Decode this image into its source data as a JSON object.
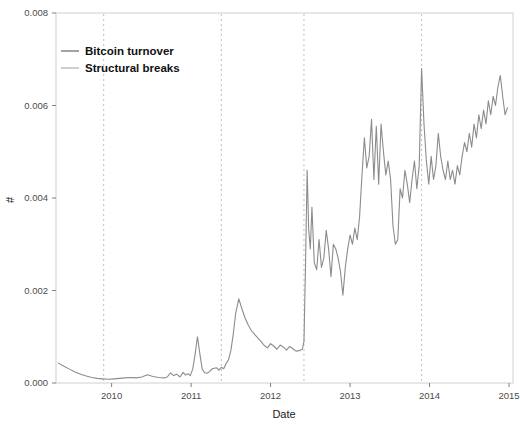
{
  "chart_data": {
    "type": "line",
    "title": "",
    "xlabel": "Date",
    "ylabel": "#",
    "xlim": [
      2009.3,
      2015.05
    ],
    "ylim": [
      0.0,
      0.008
    ],
    "grid": false,
    "legend_position": "top-left",
    "x_tick_labels": [
      "2010",
      "2011",
      "2012",
      "2013",
      "2014",
      "2015"
    ],
    "x_tick_values": [
      2010,
      2011,
      2012,
      2013,
      2014,
      2015
    ],
    "y_tick_labels": [
      "0.000",
      "0.002",
      "0.004",
      "0.006",
      "0.008"
    ],
    "y_tick_values": [
      0.0,
      0.002,
      0.004,
      0.006,
      0.008
    ],
    "series": [
      {
        "name": "Bitcoin turnover",
        "type": "line",
        "color": "#8c8c8c",
        "x": [
          2009.33,
          2009.4,
          2009.47,
          2009.54,
          2009.61,
          2009.68,
          2009.75,
          2009.82,
          2009.89,
          2009.96,
          2010.03,
          2010.1,
          2010.17,
          2010.24,
          2010.31,
          2010.38,
          2010.45,
          2010.52,
          2010.59,
          2010.66,
          2010.7,
          2010.74,
          2010.78,
          2010.82,
          2010.86,
          2010.9,
          2010.93,
          2010.96,
          2010.99,
          2011.02,
          2011.05,
          2011.08,
          2011.11,
          2011.14,
          2011.17,
          2011.2,
          2011.23,
          2011.26,
          2011.29,
          2011.32,
          2011.35,
          2011.38,
          2011.41,
          2011.44,
          2011.47,
          2011.5,
          2011.53,
          2011.56,
          2011.6,
          2011.64,
          2011.68,
          2011.72,
          2011.76,
          2011.8,
          2011.84,
          2011.88,
          2011.92,
          2011.96,
          2012.0,
          2012.04,
          2012.08,
          2012.12,
          2012.16,
          2012.2,
          2012.24,
          2012.28,
          2012.32,
          2012.36,
          2012.4,
          2012.42,
          2012.44,
          2012.46,
          2012.48,
          2012.5,
          2012.52,
          2012.55,
          2012.58,
          2012.61,
          2012.64,
          2012.67,
          2012.7,
          2012.73,
          2012.76,
          2012.79,
          2012.82,
          2012.85,
          2012.88,
          2012.91,
          2012.94,
          2012.97,
          2013.0,
          2013.03,
          2013.06,
          2013.09,
          2013.12,
          2013.15,
          2013.18,
          2013.21,
          2013.24,
          2013.27,
          2013.3,
          2013.33,
          2013.36,
          2013.39,
          2013.42,
          2013.45,
          2013.48,
          2013.51,
          2013.54,
          2013.57,
          2013.6,
          2013.63,
          2013.66,
          2013.69,
          2013.72,
          2013.75,
          2013.78,
          2013.81,
          2013.84,
          2013.87,
          2013.9,
          2013.93,
          2013.96,
          2013.99,
          2014.02,
          2014.05,
          2014.08,
          2014.11,
          2014.14,
          2014.17,
          2014.2,
          2014.23,
          2014.26,
          2014.29,
          2014.32,
          2014.35,
          2014.38,
          2014.41,
          2014.44,
          2014.47,
          2014.5,
          2014.53,
          2014.56,
          2014.59,
          2014.62,
          2014.65,
          2014.68,
          2014.71,
          2014.74,
          2014.77,
          2014.8,
          2014.83,
          2014.86,
          2014.89,
          2014.92,
          2014.95,
          2014.98
        ],
        "y": [
          0.00043,
          0.00036,
          0.0003,
          0.00024,
          0.00019,
          0.00015,
          0.00012,
          0.0001,
          9e-05,
          8e-05,
          9e-05,
          0.0001,
          0.00011,
          0.00012,
          0.00011,
          0.00013,
          0.00018,
          0.00014,
          0.00012,
          0.00011,
          0.00013,
          0.00022,
          0.00016,
          0.00019,
          0.00013,
          0.00023,
          0.00017,
          0.0002,
          0.00016,
          0.0003,
          0.00062,
          0.001,
          0.00063,
          0.0003,
          0.00022,
          0.00021,
          0.00024,
          0.0003,
          0.00032,
          0.00033,
          0.00028,
          0.00034,
          0.00031,
          0.00042,
          0.0005,
          0.0007,
          0.00105,
          0.0015,
          0.00182,
          0.0016,
          0.0014,
          0.00125,
          0.00113,
          0.00105,
          0.00097,
          0.0009,
          0.00081,
          0.00076,
          0.00085,
          0.0008,
          0.00073,
          0.00082,
          0.00078,
          0.00071,
          0.00079,
          0.00074,
          0.00069,
          0.0007,
          0.00073,
          0.0009,
          0.0026,
          0.0046,
          0.0033,
          0.0029,
          0.0038,
          0.0026,
          0.00245,
          0.0031,
          0.0025,
          0.0027,
          0.0033,
          0.0029,
          0.0023,
          0.003,
          0.0029,
          0.0027,
          0.0024,
          0.0019,
          0.0025,
          0.0029,
          0.0032,
          0.003,
          0.00335,
          0.0031,
          0.0036,
          0.0045,
          0.0053,
          0.00465,
          0.0049,
          0.0057,
          0.0044,
          0.00555,
          0.0043,
          0.0056,
          0.005,
          0.0045,
          0.0048,
          0.0044,
          0.0034,
          0.003,
          0.0031,
          0.0042,
          0.004,
          0.0046,
          0.0043,
          0.0039,
          0.0044,
          0.0048,
          0.0042,
          0.0047,
          0.0068,
          0.0056,
          0.0048,
          0.0043,
          0.0049,
          0.0044,
          0.0047,
          0.0054,
          0.0049,
          0.0046,
          0.0044,
          0.0048,
          0.0044,
          0.0046,
          0.0043,
          0.0047,
          0.0045,
          0.0049,
          0.0052,
          0.005,
          0.0054,
          0.0051,
          0.0056,
          0.0053,
          0.0058,
          0.0055,
          0.0059,
          0.0056,
          0.0061,
          0.0058,
          0.0062,
          0.006,
          0.0064,
          0.00665,
          0.0062,
          0.0058,
          0.00595
        ]
      },
      {
        "name": "Structural breaks",
        "type": "vline",
        "color": "#bfbfbf",
        "style": "dashed",
        "x": [
          2009.9,
          2011.38,
          2012.42,
          2013.9
        ]
      }
    ]
  },
  "legend": {
    "items": [
      {
        "label": "Bitcoin turnover",
        "color": "#8c8c8c"
      },
      {
        "label": "Structural breaks",
        "color": "#c4c4c4"
      }
    ]
  },
  "axes": {
    "x_title": "Date",
    "y_title": "#",
    "x_ticks": [
      "2010",
      "2011",
      "2012",
      "2013",
      "2014",
      "2015"
    ],
    "y_ticks": [
      "0.000",
      "0.002",
      "0.004",
      "0.006",
      "0.008"
    ]
  }
}
